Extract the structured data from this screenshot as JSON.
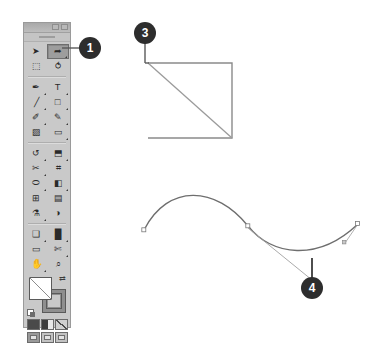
{
  "app": {
    "panel_title": "Tools",
    "window_buttons": [
      "minimize",
      "close"
    ]
  },
  "toolbox": {
    "rows": [
      [
        {
          "name": "selection-tool",
          "glyph": "➤",
          "selected": false,
          "has_flyout": false
        },
        {
          "name": "direct-selection-tool",
          "glyph": "➦",
          "selected": true,
          "has_flyout": true
        }
      ],
      [
        {
          "name": "magic-wand-tool",
          "glyph": "⬚",
          "selected": false,
          "has_flyout": false
        },
        {
          "name": "lasso-tool",
          "glyph": "⥀",
          "selected": false,
          "has_flyout": false
        }
      ],
      [
        {
          "name": "pen-tool",
          "glyph": "✒",
          "selected": false,
          "has_flyout": true
        },
        {
          "name": "type-tool",
          "glyph": "T",
          "selected": false,
          "has_flyout": true
        }
      ],
      [
        {
          "name": "line-segment-tool",
          "glyph": "╱",
          "selected": false,
          "has_flyout": true
        },
        {
          "name": "rectangle-tool",
          "glyph": "□",
          "selected": false,
          "has_flyout": true
        }
      ],
      [
        {
          "name": "paintbrush-tool",
          "glyph": "✐",
          "selected": false,
          "has_flyout": true
        },
        {
          "name": "pencil-tool",
          "glyph": "✎",
          "selected": false,
          "has_flyout": true
        }
      ],
      [
        {
          "name": "blob-brush-tool",
          "glyph": "▨",
          "selected": false,
          "has_flyout": false
        },
        {
          "name": "eraser-tool",
          "glyph": "▭",
          "selected": false,
          "has_flyout": true
        }
      ],
      [
        {
          "name": "rotate-tool",
          "glyph": "↺",
          "selected": false,
          "has_flyout": true
        },
        {
          "name": "scale-tool",
          "glyph": "⬒",
          "selected": false,
          "has_flyout": true
        }
      ],
      [
        {
          "name": "width-tool",
          "glyph": "✂",
          "selected": false,
          "has_flyout": true
        },
        {
          "name": "free-transform-tool",
          "glyph": "⌗",
          "selected": false,
          "has_flyout": false
        }
      ],
      [
        {
          "name": "shape-builder-tool",
          "glyph": "⬭",
          "selected": false,
          "has_flyout": true
        },
        {
          "name": "perspective-grid-tool",
          "glyph": "◧",
          "selected": false,
          "has_flyout": true
        }
      ],
      [
        {
          "name": "mesh-tool",
          "glyph": "⊞",
          "selected": false,
          "has_flyout": false
        },
        {
          "name": "gradient-tool",
          "glyph": "▤",
          "selected": false,
          "has_flyout": false
        }
      ],
      [
        {
          "name": "eyedropper-tool",
          "glyph": "⚗",
          "selected": false,
          "has_flyout": true
        },
        {
          "name": "blend-tool",
          "glyph": "◑",
          "selected": false,
          "has_flyout": false
        }
      ],
      [
        {
          "name": "symbol-sprayer-tool",
          "glyph": "❑",
          "selected": false,
          "has_flyout": true
        },
        {
          "name": "column-graph-tool",
          "glyph": "█",
          "selected": false,
          "has_flyout": true
        }
      ],
      [
        {
          "name": "artboard-tool",
          "glyph": "▭",
          "selected": false,
          "has_flyout": false
        },
        {
          "name": "slice-tool",
          "glyph": "✄",
          "selected": false,
          "has_flyout": true
        }
      ],
      [
        {
          "name": "hand-tool",
          "glyph": "✋",
          "selected": false,
          "has_flyout": true
        },
        {
          "name": "zoom-tool",
          "glyph": "⌕",
          "selected": false,
          "has_flyout": false
        }
      ]
    ],
    "fill_color": "#ffffff",
    "stroke_color": "#8f8f8f",
    "swap_label": "⇄",
    "paint_modes": [
      "color",
      "gradient",
      "none"
    ],
    "screen_modes": [
      "normal-screen-mode",
      "full-screen-with-menu",
      "full-screen"
    ]
  },
  "callouts": [
    {
      "label": "1",
      "name": "callout-1",
      "x": 79,
      "y": 37
    },
    {
      "label": "3",
      "name": "callout-3",
      "x": 134,
      "y": 22
    },
    {
      "label": "4",
      "name": "callout-4",
      "x": 301,
      "y": 277
    }
  ],
  "artwork": {
    "shape_label": "rectangle-with-diagonal",
    "rect": {
      "x1": 148,
      "y1": 63,
      "x2": 232,
      "y2": 138
    },
    "curve_label": "bezier-s-curve",
    "curve_anchors": [
      {
        "x": 144,
        "y": 230
      },
      {
        "x": 248,
        "y": 226
      },
      {
        "x": 358,
        "y": 224
      }
    ],
    "stroke_color": "#6e6e6e",
    "anchor_color": "#9a9a9a"
  }
}
